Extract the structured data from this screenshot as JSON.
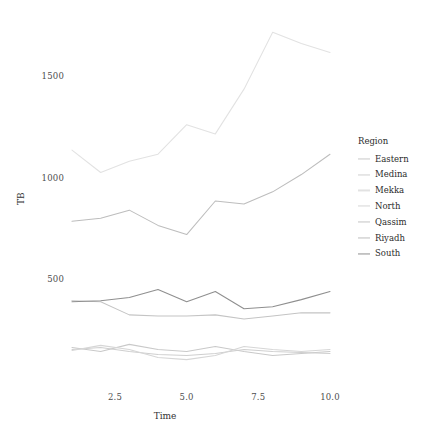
{
  "chart_data": {
    "type": "line",
    "title": "",
    "xlabel": "Time",
    "ylabel": "TB",
    "xlim": [
      1,
      10
    ],
    "ylim": [
      0,
      1780
    ],
    "xticks": [
      "2.5",
      "5.0",
      "7.5",
      "10.0"
    ],
    "xtick_values": [
      2.5,
      5.0,
      7.5,
      10.0
    ],
    "yticks": [
      "500",
      "1000",
      "1500"
    ],
    "ytick_values": [
      500,
      1000,
      1500
    ],
    "grid": false,
    "legend_position": "right",
    "legend_title": "Region",
    "x": [
      1,
      2,
      3,
      4,
      5,
      6,
      7,
      8,
      9,
      10
    ],
    "series": [
      {
        "name": "Eastern",
        "color": "#c9c9c9",
        "values": [
          170,
          150,
          185,
          160,
          150,
          175,
          150,
          130,
          140,
          150
        ]
      },
      {
        "name": "Medina",
        "color": "#cfcfcf",
        "values": [
          160,
          170,
          150,
          135,
          130,
          140,
          160,
          150,
          145,
          140
        ]
      },
      {
        "name": "Mekka",
        "color": "#e2e2e2",
        "values": [
          1140,
          1030,
          1085,
          1120,
          1265,
          1220,
          1440,
          1720,
          1665,
          1620
        ]
      },
      {
        "name": "North",
        "color": "#d6d6d6",
        "values": [
          155,
          180,
          160,
          120,
          110,
          130,
          175,
          160,
          150,
          160
        ]
      },
      {
        "name": "Qassim",
        "color": "#c4c4c4",
        "values": [
          400,
          395,
          330,
          325,
          325,
          330,
          310,
          325,
          340,
          340
        ]
      },
      {
        "name": "Riyadh",
        "color": "#bdbdbd",
        "values": [
          790,
          805,
          845,
          770,
          725,
          890,
          875,
          935,
          1020,
          1120
        ]
      },
      {
        "name": "South",
        "color": "#8f8f8f",
        "values": [
          395,
          400,
          415,
          455,
          395,
          445,
          360,
          370,
          405,
          445
        ]
      }
    ]
  },
  "axis": {
    "y_title": "TB",
    "x_title": "Time"
  },
  "legend": {
    "title": "Region",
    "items": [
      {
        "label": "Eastern",
        "color": "#c9c9c9"
      },
      {
        "label": "Medina",
        "color": "#cfcfcf"
      },
      {
        "label": "Mekka",
        "color": "#e2e2e2"
      },
      {
        "label": "North",
        "color": "#d6d6d6"
      },
      {
        "label": "Qassim",
        "color": "#c4c4c4"
      },
      {
        "label": "Riyadh",
        "color": "#bdbdbd"
      },
      {
        "label": "South",
        "color": "#8f8f8f"
      }
    ]
  }
}
